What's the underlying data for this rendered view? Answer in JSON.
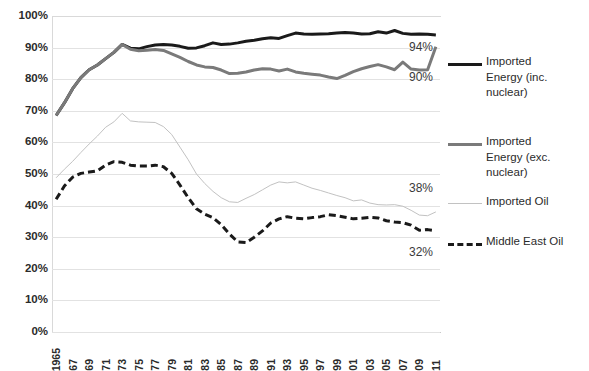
{
  "chart_data": {
    "type": "line",
    "title": "",
    "subtitle": "",
    "xlabel": "",
    "ylabel": "",
    "ylim": [
      0,
      100
    ],
    "ytick_labels": [
      "100%",
      "90%",
      "80%",
      "70%",
      "60%",
      "50%",
      "40%",
      "30%",
      "20%",
      "10%",
      "0%"
    ],
    "ytick_values": [
      100,
      90,
      80,
      70,
      60,
      50,
      40,
      30,
      20,
      10,
      0
    ],
    "grid": true,
    "legend_position": "right",
    "x": [
      1965,
      1966,
      1967,
      1968,
      1969,
      1970,
      1971,
      1972,
      1973,
      1974,
      1975,
      1976,
      1977,
      1978,
      1979,
      1980,
      1981,
      1982,
      1983,
      1984,
      1985,
      1986,
      1987,
      1988,
      1989,
      1990,
      1991,
      1992,
      1993,
      1994,
      1995,
      1996,
      1997,
      1998,
      1999,
      2000,
      2001,
      2002,
      2003,
      2004,
      2005,
      2006,
      2007,
      2008,
      2009,
      2010,
      2011
    ],
    "xtick_labels": [
      "1965",
      "67",
      "69",
      "71",
      "73",
      "75",
      "77",
      "79",
      "81",
      "83",
      "85",
      "87",
      "89",
      "91",
      "93",
      "95",
      "97",
      "99",
      "01",
      "03",
      "05",
      "07",
      "09",
      "11"
    ],
    "xtick_values": [
      1965,
      1967,
      1969,
      1971,
      1973,
      1975,
      1977,
      1979,
      1981,
      1983,
      1985,
      1987,
      1989,
      1991,
      1993,
      1995,
      1997,
      1999,
      2001,
      2003,
      2005,
      2007,
      2009,
      2011
    ],
    "series": [
      {
        "name": "Imported Energy (inc. nuclear)",
        "color": "#1a1a1a",
        "style": "solid",
        "width": 3,
        "end_label": "94%",
        "values": [
          68.5,
          72.5,
          77.0,
          80.5,
          83.0,
          84.5,
          86.5,
          88.5,
          91.0,
          89.8,
          89.6,
          90.3,
          90.8,
          91.0,
          90.8,
          90.4,
          89.8,
          89.9,
          90.6,
          91.5,
          91.0,
          91.1,
          91.5,
          92.0,
          92.3,
          92.8,
          93.1,
          92.9,
          93.8,
          94.6,
          94.3,
          94.2,
          94.3,
          94.4,
          94.6,
          94.8,
          94.6,
          94.3,
          94.4,
          95.0,
          94.6,
          95.4,
          94.5,
          94.2,
          94.3,
          94.2,
          94.0
        ]
      },
      {
        "name": "Imported Energy (exc. nuclear)",
        "color": "#7a7a7a",
        "style": "solid",
        "width": 3,
        "end_label": "90%",
        "values": [
          68.5,
          72.5,
          77.0,
          80.5,
          83.0,
          84.5,
          86.5,
          88.5,
          91.0,
          89.5,
          89.0,
          89.2,
          89.4,
          89.1,
          88.0,
          86.9,
          85.6,
          84.5,
          83.9,
          83.7,
          82.9,
          81.8,
          81.9,
          82.3,
          82.9,
          83.3,
          83.2,
          82.6,
          83.2,
          82.3,
          81.9,
          81.6,
          81.3,
          80.7,
          80.2,
          81.2,
          82.4,
          83.3,
          84.0,
          84.6,
          83.9,
          83.0,
          85.4,
          83.2,
          82.9,
          83.0,
          90.3
        ]
      },
      {
        "name": "Imported Oil",
        "color": "#c2c2c2",
        "style": "solid",
        "width": 1,
        "end_label": "38%",
        "values": [
          48.8,
          51.5,
          54.0,
          56.8,
          59.5,
          62.0,
          64.8,
          66.5,
          69.2,
          66.8,
          66.5,
          66.4,
          66.3,
          65.0,
          62.5,
          58.5,
          54.5,
          50.0,
          47.0,
          44.5,
          42.5,
          41.2,
          41.0,
          42.3,
          43.5,
          45.0,
          46.5,
          47.5,
          47.2,
          47.5,
          46.5,
          45.5,
          44.8,
          44.0,
          43.2,
          42.5,
          41.5,
          41.8,
          40.8,
          40.3,
          40.2,
          40.3,
          39.8,
          38.5,
          37.0,
          36.8,
          38.0
        ]
      },
      {
        "name": "Middle East Oil",
        "color": "#1a1a1a",
        "style": "dashed",
        "width": 3,
        "end_label": "32%",
        "values": [
          42.0,
          46.2,
          49.0,
          50.2,
          50.6,
          51.0,
          52.8,
          53.9,
          53.7,
          52.8,
          52.5,
          52.5,
          52.8,
          52.3,
          50.2,
          46.5,
          42.5,
          39.0,
          37.3,
          36.2,
          34.0,
          31.0,
          28.5,
          28.3,
          30.0,
          32.0,
          34.5,
          35.8,
          36.5,
          36.0,
          35.8,
          36.2,
          36.5,
          37.1,
          36.8,
          36.3,
          35.8,
          36.0,
          36.3,
          36.1,
          35.2,
          34.8,
          34.6,
          33.8,
          32.2,
          32.4,
          32.0
        ]
      }
    ],
    "annotations": [
      {
        "text": "94%",
        "series": "Imported Energy (inc. nuclear)"
      },
      {
        "text": "90%",
        "series": "Imported Energy (exc. nuclear)"
      },
      {
        "text": "38%",
        "series": "Imported Oil"
      },
      {
        "text": "32%",
        "series": "Middle East Oil"
      }
    ]
  },
  "legend": {
    "items": [
      {
        "label": "Imported Energy (inc. nuclear)",
        "display": "Imported\nEnergy (inc.\nnuclear)",
        "swatch": "thick-solid-black-line-icon"
      },
      {
        "label": "Imported Energy (exc. nuclear)",
        "display": "Imported\nEnergy (exc.\nnuclear)",
        "swatch": "thick-solid-gray-line-icon"
      },
      {
        "label": "Imported Oil",
        "display": "Imported Oil",
        "swatch": "thin-solid-lightgray-line-icon"
      },
      {
        "label": "Middle East Oil",
        "display": "Middle East Oil",
        "swatch": "thick-dashed-black-line-icon"
      }
    ]
  }
}
